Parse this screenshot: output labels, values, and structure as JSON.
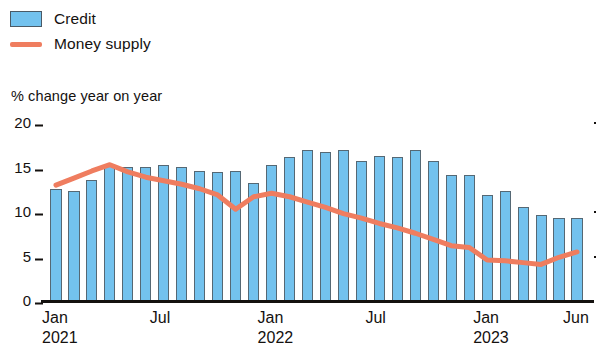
{
  "legend": {
    "items": [
      {
        "label": "Credit",
        "marker": "bar-swatch",
        "color": "#73c2ee"
      },
      {
        "label": "Money supply",
        "marker": "line-swatch",
        "color": "#ef7d5f"
      }
    ]
  },
  "axis_title": "% change year on year",
  "colors": {
    "bar": "#73c2ee",
    "bar_edge": "#556874",
    "line": "#ef7d5f",
    "axis": "#14110f",
    "background": "#ffffff"
  },
  "chart_data": {
    "type": "bar",
    "title": "",
    "subtitle": "",
    "xlabel": "",
    "ylabel": "% change year on year",
    "ylim": [
      0,
      20
    ],
    "yticks": [
      0,
      5,
      10,
      15,
      20
    ],
    "ytick_labels": [
      "0",
      "5",
      "10",
      "15",
      "20"
    ],
    "grid": false,
    "legend_position": "top-left",
    "x": [
      "Jan 2021",
      "Feb 2021",
      "Mar 2021",
      "Apr 2021",
      "May 2021",
      "Jun 2021",
      "Jul 2021",
      "Aug 2021",
      "Sep 2021",
      "Oct 2021",
      "Nov 2021",
      "Dec 2021",
      "Jan 2022",
      "Feb 2022",
      "Mar 2022",
      "Apr 2022",
      "May 2022",
      "Jun 2022",
      "Jul 2022",
      "Aug 2022",
      "Sep 2022",
      "Oct 2022",
      "Nov 2022",
      "Dec 2022",
      "Jan 2023",
      "Feb 2023",
      "Mar 2023",
      "Apr 2023",
      "May 2023",
      "Jun 2023"
    ],
    "xtick_labels": [
      {
        "index": 0,
        "label": "Jan",
        "year": "2021"
      },
      {
        "index": 6,
        "label": "Jul",
        "year": ""
      },
      {
        "index": 12,
        "label": "Jan",
        "year": "2022"
      },
      {
        "index": 18,
        "label": "Jul",
        "year": ""
      },
      {
        "index": 24,
        "label": "Jan",
        "year": "2023"
      },
      {
        "index": 29,
        "label": "Jun",
        "year": ""
      }
    ],
    "series": [
      {
        "name": "Credit",
        "type": "bar",
        "color": "#73c2ee",
        "values": [
          12.5,
          12.2,
          13.5,
          15.3,
          14.9,
          15.0,
          15.2,
          15.0,
          14.5,
          14.4,
          14.5,
          13.2,
          15.2,
          16.1,
          16.8,
          16.6,
          16.8,
          15.6,
          16.2,
          16.1,
          16.8,
          15.6,
          14.1,
          14.1,
          11.8,
          12.2,
          10.5,
          9.6,
          9.2,
          9.2
        ]
      },
      {
        "name": "Money supply",
        "type": "line",
        "color": "#ef7d5f",
        "values": [
          12.9,
          13.7,
          14.5,
          15.2,
          14.4,
          13.8,
          13.4,
          13.0,
          12.5,
          11.8,
          10.2,
          11.6,
          12.0,
          11.6,
          11.0,
          10.4,
          9.7,
          9.2,
          8.6,
          8.1,
          7.5,
          6.8,
          6.1,
          5.9,
          4.5,
          4.4,
          4.2,
          4.0,
          4.8,
          5.4
        ]
      }
    ]
  }
}
